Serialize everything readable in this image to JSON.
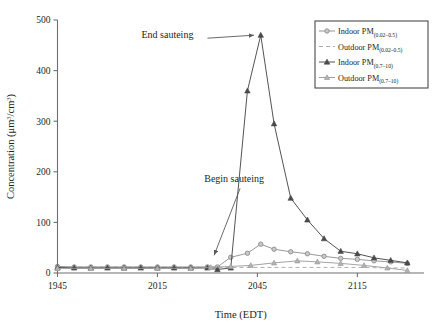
{
  "chart_data": {
    "type": "line",
    "title": "",
    "xlabel": "Time (EDT)",
    "ylabel": "Concentration (μm3/cm3)",
    "ylabel_parts": {
      "main": "Concentration (μm",
      "sup1": "3",
      "mid": "/cm",
      "sup2": "3",
      "tail": ")"
    },
    "xlim": [
      1945,
      2135
    ],
    "ylim": [
      0,
      500
    ],
    "xticks": [
      1945,
      2015,
      2045,
      2115
    ],
    "xtick_labels": [
      "1945",
      "2015",
      "2045",
      "2115"
    ],
    "yticks": [
      0,
      100,
      200,
      300,
      400,
      500
    ],
    "ytick_labels": [
      "0",
      "100",
      "200",
      "300",
      "400",
      "500"
    ],
    "grid": false,
    "legend_position": "top-right",
    "series": [
      {
        "name": "Indoor PM(0.02-0.5)",
        "label_main": "Indoor PM",
        "label_sub": "(0.02–0.5)",
        "marker": "circle",
        "linestyle": "solid",
        "color": "#8d8d8d",
        "x": [
          1945,
          1950,
          1955,
          2000,
          2005,
          2010,
          2015,
          2020,
          2025,
          2030,
          2033,
          2037,
          2042,
          2046,
          2050,
          2055,
          2100,
          2105,
          2110,
          2115,
          2120,
          2125,
          2130
        ],
        "values": [
          13,
          12,
          12,
          12,
          12,
          12,
          12,
          12,
          12,
          12,
          12,
          31,
          39,
          57,
          47,
          42,
          38,
          33,
          29,
          27,
          24,
          22,
          19
        ]
      },
      {
        "name": "Outdoor PM(0.02-0.5)",
        "label_main": "Outdoor PM",
        "label_sub": "(0.02–0.5)",
        "marker": "none",
        "linestyle": "dashed",
        "color": "#a8a8a8",
        "x": [
          1945,
          1955,
          2005,
          2015,
          2025,
          2035,
          2045,
          2055,
          2105,
          2115,
          2125,
          2130
        ],
        "values": [
          12,
          12,
          12,
          11,
          11,
          11,
          11,
          11,
          11,
          11,
          10,
          10
        ]
      },
      {
        "name": "Indoor PM(0.7-10)",
        "label_main": "Indoor PM",
        "label_sub": "(0.7–10)",
        "marker": "triangle-filled",
        "linestyle": "solid",
        "color": "#4a4a4a",
        "x": [
          1945,
          1950,
          1955,
          2000,
          2005,
          2010,
          2015,
          2020,
          2025,
          2030,
          2033,
          2037,
          2042,
          2046,
          2050,
          2055,
          2100,
          2105,
          2110,
          2115,
          2120,
          2125,
          2130
        ],
        "values": [
          11,
          10,
          10,
          10,
          10,
          10,
          10,
          10,
          10,
          10,
          7,
          10,
          360,
          470,
          295,
          148,
          105,
          68,
          43,
          38,
          30,
          25,
          20
        ]
      },
      {
        "name": "Outdoor PM(0.7-10)",
        "label_main": "Outdoor PM",
        "label_sub": "(0.7–10)",
        "marker": "triangle-light",
        "linestyle": "solid",
        "color": "#9a9a9a",
        "x": [
          1945,
          1955,
          2005,
          2015,
          2025,
          2031,
          2037,
          2043,
          2050,
          2057,
          2103,
          2110,
          2117,
          2124,
          2130
        ],
        "values": [
          9,
          9,
          9,
          9,
          9,
          11,
          13,
          15,
          20,
          24,
          22,
          19,
          15,
          10,
          5
        ]
      }
    ],
    "annotations": [
      {
        "text": "End sauteing",
        "x": 2018,
        "y": 470,
        "arrow_to_x": 2044,
        "arrow_to_y": 470
      },
      {
        "text": "Begin sauteing",
        "x": 1998,
        "y": 185,
        "arrow_to_x": 2032,
        "arrow_to_y": 35
      }
    ]
  },
  "colors": {
    "axis": "#6f6f6f",
    "text": "#231f20",
    "legend_border": "#4a4a4a",
    "annotation": "#5a5a5a",
    "background": "#ffffff"
  }
}
